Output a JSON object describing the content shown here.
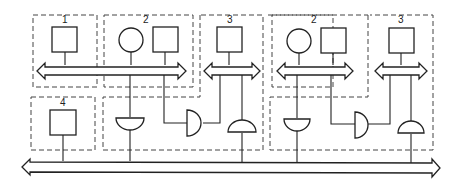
{
  "diagram": {
    "type": "block-diagram",
    "modules": [
      {
        "id": "m1",
        "label": "1",
        "components": [
          "square"
        ]
      },
      {
        "id": "m2a",
        "label": "2",
        "components": [
          "circle",
          "square"
        ]
      },
      {
        "id": "m3a",
        "label": "3",
        "components": [
          "square"
        ]
      },
      {
        "id": "m2b",
        "label": "2",
        "components": [
          "circle",
          "square"
        ]
      },
      {
        "id": "m3b",
        "label": "3",
        "components": [
          "square"
        ]
      },
      {
        "id": "m4",
        "label": "4",
        "components": [
          "square"
        ]
      }
    ],
    "buses": [
      {
        "id": "local-bus-1-2",
        "connects": [
          "1",
          "2"
        ],
        "direction": "bidirectional"
      },
      {
        "id": "local-bus-3a",
        "connects": [
          "3"
        ],
        "direction": "bidirectional"
      },
      {
        "id": "local-bus-2b",
        "connects": [
          "2"
        ],
        "direction": "bidirectional"
      },
      {
        "id": "local-bus-3b",
        "connects": [
          "3"
        ],
        "direction": "bidirectional"
      },
      {
        "id": "system-bus",
        "connects": [
          "4",
          "gates"
        ],
        "direction": "bidirectional"
      }
    ],
    "gates": [
      {
        "id": "gate-a1",
        "orientation": "down"
      },
      {
        "id": "gate-a2",
        "orientation": "right"
      },
      {
        "id": "gate-a3",
        "orientation": "up"
      },
      {
        "id": "gate-b1",
        "orientation": "down"
      },
      {
        "id": "gate-b2",
        "orientation": "right"
      },
      {
        "id": "gate-b3",
        "orientation": "up"
      }
    ]
  }
}
